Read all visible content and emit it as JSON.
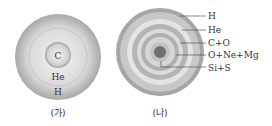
{
  "diagram_a": {
    "caption": "(가)",
    "layers": [
      "C",
      "He",
      "H"
    ]
  },
  "diagram_b": {
    "caption": "(나)",
    "layers": [
      "H",
      "He",
      "C+O",
      "O+Ne+Mg",
      "Si+S"
    ]
  }
}
